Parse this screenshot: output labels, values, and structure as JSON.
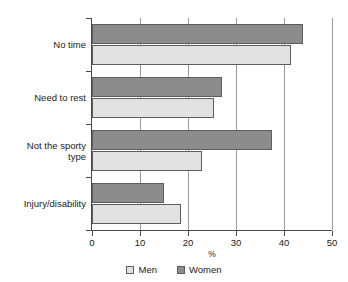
{
  "chart_data": {
    "type": "bar",
    "orientation": "horizontal",
    "title": "",
    "xlabel": "%",
    "ylabel": "",
    "xlim": [
      0,
      50
    ],
    "xticks": [
      0,
      10,
      20,
      30,
      40,
      50
    ],
    "xtick_labels": [
      "0",
      "10",
      "20",
      "30",
      "40",
      "50"
    ],
    "grid": true,
    "grid_axis": "x",
    "legend_position": "bottom",
    "categories": [
      "No time",
      "Need to rest",
      "Not the sporty\ntype",
      "Injury/disability"
    ],
    "series": [
      {
        "name": "Men",
        "color": "#e2e2e2",
        "values": [
          41.5,
          25.5,
          23,
          18.5
        ]
      },
      {
        "name": "Women",
        "color": "#8c8c8c",
        "values": [
          44,
          27,
          37.5,
          15
        ]
      }
    ]
  },
  "legend": {
    "items": [
      {
        "label": "Men",
        "swatch": "men"
      },
      {
        "label": "Women",
        "swatch": "women"
      }
    ]
  },
  "axis": {
    "x_title": "%"
  },
  "colors": {
    "men_fill": "#e2e2e2",
    "women_fill": "#8c8c8c",
    "bar_stroke": "#5d5d5d",
    "axis": "#4a4a4a",
    "gridline": "#9a9a9a",
    "text": "#1a1a1a",
    "background": "#ffffff"
  }
}
